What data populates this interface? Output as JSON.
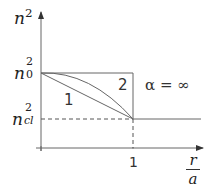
{
  "diagram": {
    "y_axis_label": {
      "base": "n",
      "sup": "2"
    },
    "x_axis_label": {
      "numerator": "r",
      "denominator": "a"
    },
    "y_ticks": [
      {
        "base": "n",
        "sub": "0",
        "sup": "2",
        "meaning": "core index squared"
      },
      {
        "base": "n",
        "sub": "cl",
        "sup": "2",
        "meaning": "cladding index squared"
      }
    ],
    "x_ticks": [
      {
        "label": "1"
      }
    ],
    "curves": [
      {
        "label": "1",
        "shape": "linear profile (alpha = 1)"
      },
      {
        "label": "2",
        "shape": "parabolic profile (alpha = 2)"
      },
      {
        "label": "α = ∞",
        "shape": "step profile"
      }
    ],
    "annotation": "α = ∞",
    "colors": {
      "line": "#555555",
      "text": "#222222",
      "background": "#ffffff"
    }
  }
}
